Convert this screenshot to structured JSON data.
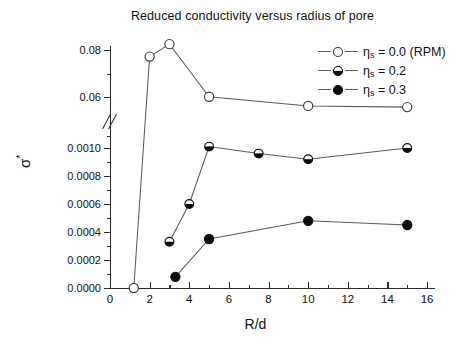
{
  "chart_data": {
    "type": "scatter",
    "title": "Reduced conductivity versus radius of pore",
    "xlabel": "R/d",
    "ylabel": "σ*",
    "xlim": [
      0,
      16.4
    ],
    "xticks": [
      0,
      2,
      4,
      6,
      8,
      10,
      12,
      14,
      16
    ],
    "xtick_labels": [
      "0",
      "2",
      "4",
      "6",
      "8",
      "10",
      "12",
      "14",
      "16"
    ],
    "grid": false,
    "broken_axis": true,
    "y_upper_range": [
      0.055,
      0.086
    ],
    "y_upper_ticks": [
      0.06,
      0.08
    ],
    "y_upper_tick_labels": [
      "0.06",
      "0.08"
    ],
    "y_lower_range": [
      0.0,
      0.00108
    ],
    "y_lower_ticks": [
      0.0,
      0.0002,
      0.0004,
      0.0006,
      0.0008,
      0.001
    ],
    "y_lower_tick_labels": [
      "0.0000",
      "0.0002",
      "0.0004",
      "0.0006",
      "0.0008",
      "0.0010"
    ],
    "legend_position": "top-right",
    "series": [
      {
        "name": "η_s = 0.0 (RPM)",
        "marker": "open-circle",
        "panel": "upper",
        "x": [
          1.2,
          2.0,
          3.0,
          5.0,
          10.0,
          15.0
        ],
        "y": [
          0.0,
          0.0772,
          0.0825,
          0.0601,
          0.0562,
          0.0557
        ]
      },
      {
        "name": "η_s = 0.2",
        "marker": "half-filled-circle",
        "panel": "lower",
        "x": [
          3.0,
          4.0,
          5.0,
          7.5,
          10.0,
          15.0
        ],
        "y": [
          0.00033,
          0.0006,
          0.00101,
          0.00096,
          0.00092,
          0.001
        ]
      },
      {
        "name": "η_s = 0.3",
        "marker": "filled-circle",
        "panel": "lower",
        "x": [
          3.3,
          5.0,
          10.0,
          15.0
        ],
        "y": [
          8e-05,
          0.00035,
          0.00048,
          0.00045
        ]
      }
    ]
  },
  "legend": {
    "items": [
      {
        "symbol": "open-circle",
        "label_eta": "η",
        "label_sub": "s",
        "label_rest": " = 0.0 (RPM)"
      },
      {
        "symbol": "half-filled-circle",
        "label_eta": "η",
        "label_sub": "s",
        "label_rest": " = 0.2"
      },
      {
        "symbol": "filled-circle",
        "label_eta": "η",
        "label_sub": "s",
        "label_rest": " = 0.3"
      }
    ]
  },
  "axis_title": {
    "x": "R/d",
    "y_base": "σ",
    "y_sup": "*"
  }
}
